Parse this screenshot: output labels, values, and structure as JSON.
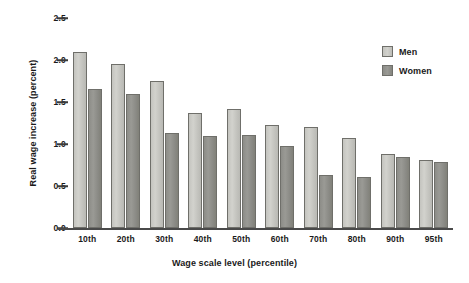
{
  "chart_data": {
    "type": "bar",
    "title": "",
    "xlabel": "Wage scale level (percentile)",
    "ylabel": "Real wage increase (percent)",
    "categories": [
      "10th",
      "20th",
      "30th",
      "40th",
      "50th",
      "60th",
      "70th",
      "80th",
      "90th",
      "95th"
    ],
    "series": [
      {
        "name": "Men",
        "values": [
          2.1,
          1.95,
          1.75,
          1.37,
          1.42,
          1.23,
          1.2,
          1.07,
          0.88,
          0.81
        ]
      },
      {
        "name": "Women",
        "values": [
          1.65,
          1.59,
          1.13,
          1.09,
          1.11,
          0.98,
          0.63,
          0.61,
          0.85,
          0.79
        ]
      }
    ],
    "ylim": [
      0.0,
      2.5
    ],
    "yticks": [
      "2.5",
      "2.0",
      "1.5",
      "1.0",
      "0.5",
      "0.0"
    ],
    "ytick_values": [
      2.5,
      2.0,
      1.5,
      1.0,
      0.5,
      0.0
    ],
    "grid": false,
    "legend_position": "top-right"
  },
  "legend": {
    "entries": [
      {
        "label": "Men",
        "color": "#c9c9c4"
      },
      {
        "label": "Women",
        "color": "#8a8a85"
      }
    ]
  },
  "colors": {
    "men_bar": "#c9c9c4",
    "women_bar": "#8a8a85",
    "axis": "#4a4a4a",
    "text": "#1a1a1a",
    "background": "#ffffff"
  }
}
